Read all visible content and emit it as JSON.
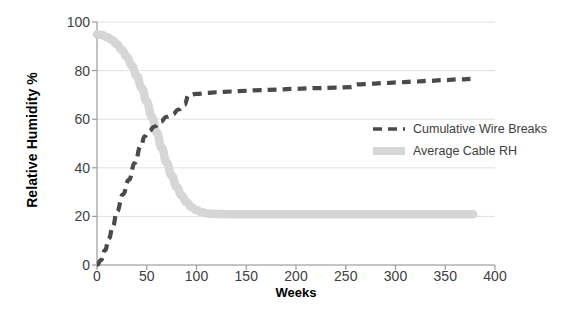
{
  "chart_data": {
    "type": "line",
    "title": "",
    "xlabel": "Weeks",
    "ylabel": "Relative Humidity %",
    "xlim": [
      0,
      400
    ],
    "ylim": [
      0,
      100
    ],
    "xticks": [
      0,
      50,
      100,
      150,
      200,
      250,
      300,
      350,
      400
    ],
    "yticks": [
      0,
      20,
      40,
      60,
      80,
      100
    ],
    "grid": "horizontal",
    "legend_position": "center-right",
    "colors": {
      "cumulative_wire_breaks": "#4a4a4a",
      "average_cable_rh": "#d6d6d6",
      "gridline": "#e0e0e0",
      "axis": "#9a9a9a",
      "text": "#404040"
    },
    "series": [
      {
        "name": "Cumulative Wire Breaks",
        "style": "dashed",
        "color": "#4a4a4a",
        "x": [
          0,
          4,
          8,
          12,
          16,
          20,
          26,
          32,
          38,
          44,
          48,
          52,
          58,
          64,
          70,
          76,
          82,
          88,
          92,
          100,
          110,
          120,
          135,
          150,
          165,
          180,
          200,
          220,
          240,
          255,
          262,
          275,
          290,
          305,
          320,
          335,
          350,
          365,
          378
        ],
        "values": [
          0,
          2,
          6,
          11,
          16,
          22,
          29,
          35,
          42,
          49,
          53,
          55,
          57,
          59,
          61,
          62,
          64,
          66,
          70,
          70.4,
          70.8,
          71.1,
          71.4,
          71.7,
          72,
          72.2,
          72.5,
          72.8,
          73,
          73.2,
          74.3,
          74.6,
          74.9,
          75.2,
          75.5,
          75.8,
          76.1,
          76.4,
          76.6
        ]
      },
      {
        "name": "Average Cable RH",
        "style": "thick-solid",
        "color": "#d6d6d6",
        "x": [
          0,
          5,
          10,
          15,
          20,
          25,
          30,
          35,
          40,
          45,
          50,
          55,
          60,
          65,
          70,
          75,
          80,
          85,
          90,
          95,
          100,
          105,
          110,
          115,
          120,
          130,
          140,
          160,
          180,
          200,
          230,
          260,
          300,
          340,
          378
        ],
        "values": [
          95,
          94.6,
          93.8,
          92.6,
          90.8,
          88.5,
          85.6,
          82,
          77.8,
          72.8,
          67.2,
          61,
          54.6,
          48.2,
          42.2,
          36.8,
          32.2,
          28.6,
          25.8,
          23.9,
          22.6,
          21.8,
          21.3,
          21.1,
          21,
          20.9,
          20.9,
          20.9,
          20.9,
          20.9,
          20.9,
          20.9,
          20.9,
          20.9,
          20.9
        ]
      }
    ],
    "legend": [
      {
        "label": "Cumulative Wire Breaks",
        "swatch": "dashed-dark"
      },
      {
        "label": "Average Cable RH",
        "swatch": "band-light"
      }
    ]
  }
}
